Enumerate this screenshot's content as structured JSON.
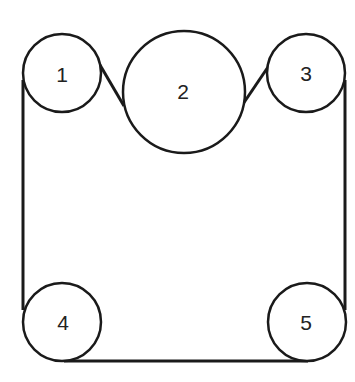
{
  "diagram": {
    "type": "belt-and-pulley",
    "stroke_color": "#1a1a1a",
    "pulleys": [
      {
        "label": "1",
        "cx": 62,
        "cy": 73,
        "r": 39
      },
      {
        "label": "2",
        "cx": 184,
        "cy": 92,
        "r": 61
      },
      {
        "label": "3",
        "cx": 306,
        "cy": 73,
        "r": 39
      },
      {
        "label": "4",
        "cx": 62,
        "cy": 322,
        "r": 39
      },
      {
        "label": "5",
        "cx": 307,
        "cy": 322,
        "r": 39
      }
    ]
  }
}
